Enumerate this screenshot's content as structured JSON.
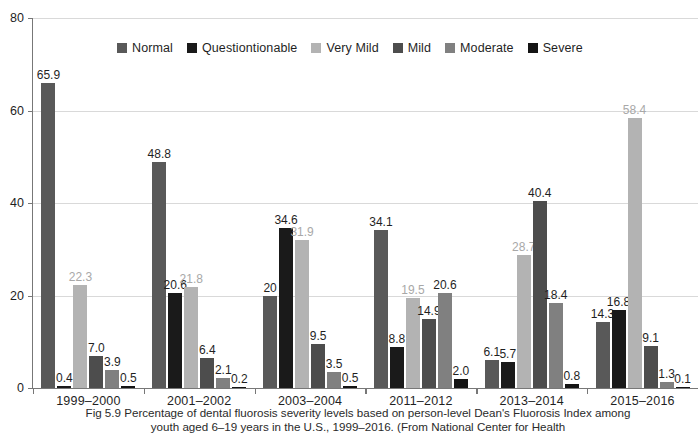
{
  "figure": {
    "caption_prefix": "Fig 5.9",
    "caption_line1": " Percentage of dental fluorosis severity levels based on person-level Dean's Fluorosis",
    "caption_line2": "Index among youth aged 6–19 years in the U.S., 1999–2016. (From National Center for Health"
  },
  "chart_data": {
    "type": "bar",
    "title": "",
    "xlabel": "",
    "ylabel": "",
    "ylim": [
      0,
      80
    ],
    "yticks": [
      0,
      20,
      40,
      60,
      80
    ],
    "ytick_labels": [
      "0",
      "20",
      "40",
      "60",
      "80"
    ],
    "grid": true,
    "legend_position": "top-center",
    "categories": [
      "1999–2000",
      "2001–2002",
      "2003–2004",
      "2011–2012",
      "2013–2014",
      "2015–2016"
    ],
    "series": [
      {
        "name": "Normal",
        "color": "#595959",
        "values": [
          65.9,
          48.8,
          20,
          34.1,
          6.1,
          14.3
        ],
        "labels": [
          "65.9",
          "48.8",
          "20",
          "34.1",
          "6.1",
          "14.3"
        ]
      },
      {
        "name": "Questiontionable",
        "color": "#1a1a1a",
        "values": [
          0.4,
          20.6,
          34.6,
          8.8,
          5.7,
          16.8
        ],
        "labels": [
          "0.4",
          "20.6",
          "34.6",
          "8.8",
          "5.7",
          "16.8"
        ]
      },
      {
        "name": "Very Mild",
        "color": "#b3b3b3",
        "values": [
          22.3,
          21.8,
          31.9,
          19.5,
          28.7,
          58.4
        ],
        "labels": [
          "22.3",
          "21.8",
          "31.9",
          "19.5",
          "28.7",
          "58.4"
        ]
      },
      {
        "name": "Mild",
        "color": "#4d4d4d",
        "values": [
          7.0,
          6.4,
          9.5,
          14.9,
          40.4,
          9.1
        ],
        "labels": [
          "7.0",
          "6.4",
          "9.5",
          "14.9",
          "40.4",
          "9.1"
        ]
      },
      {
        "name": "Moderate",
        "color": "#808080",
        "values": [
          3.9,
          2.1,
          3.5,
          20.6,
          18.4,
          1.3
        ],
        "labels": [
          "3.9",
          "2.1",
          "3.5",
          "20.6",
          "18.4",
          "1.3"
        ]
      },
      {
        "name": "Severe",
        "color": "#141414",
        "values": [
          0.5,
          0.2,
          0.5,
          2.0,
          0.8,
          0.1
        ],
        "labels": [
          "0.5",
          "0.2",
          "0.5",
          "2.0",
          "0.8",
          "0.1"
        ]
      }
    ]
  }
}
